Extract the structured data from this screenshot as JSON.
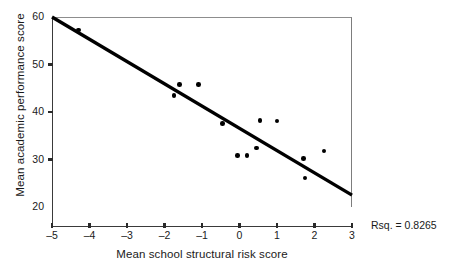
{
  "chart_data": {
    "type": "scatter",
    "title": "",
    "xlabel": "Mean school structural risk score",
    "ylabel": "Mean academic performance score",
    "xlim": [
      -5,
      3
    ],
    "ylim": [
      20,
      60
    ],
    "xticks": [
      -5,
      -4,
      -3,
      -2,
      -1,
      0,
      1,
      2,
      3
    ],
    "xticklabels": [
      "–5",
      "–4",
      "–3",
      "–2",
      "–1",
      "0",
      "1",
      "2",
      "3"
    ],
    "yticks": [
      20,
      30,
      40,
      50,
      60
    ],
    "yticklabels": [
      "20",
      "30",
      "40",
      "50",
      "60"
    ],
    "grid": false,
    "legend": null,
    "marker_color": "#000000",
    "line_color": "#000000",
    "points": [
      {
        "x": -4.3,
        "y": 57.3
      },
      {
        "x": -1.75,
        "y": 43.5
      },
      {
        "x": -1.6,
        "y": 45.8
      },
      {
        "x": -1.1,
        "y": 45.8
      },
      {
        "x": -0.45,
        "y": 37.6
      },
      {
        "x": -0.05,
        "y": 30.9
      },
      {
        "x": 0.2,
        "y": 30.8
      },
      {
        "x": 0.45,
        "y": 32.4
      },
      {
        "x": 0.55,
        "y": 38.2
      },
      {
        "x": 1.0,
        "y": 38.1
      },
      {
        "x": 1.7,
        "y": 30.2
      },
      {
        "x": 1.75,
        "y": 26.1
      },
      {
        "x": 2.25,
        "y": 31.8
      }
    ],
    "fit_line": {
      "x_start": -5,
      "y_start": 60.0,
      "x_end": 3,
      "y_end": 22.5,
      "slope": -4.6875,
      "intercept": 36.5625
    },
    "annotations": [
      {
        "name": "r-squared",
        "text": "Rsq. = 0.8265",
        "value": 0.8265
      }
    ]
  }
}
